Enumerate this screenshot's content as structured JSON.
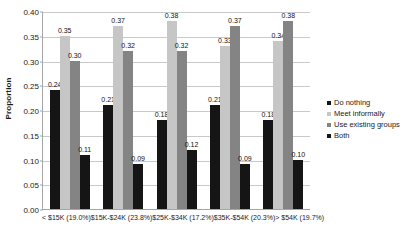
{
  "chart_data": {
    "type": "bar",
    "title": "",
    "xlabel": "",
    "ylabel": "Proportion",
    "ylim": [
      0.0,
      0.4
    ],
    "ytick_labels": [
      "0.00",
      "0.05",
      "0.10",
      "0.15",
      "0.20",
      "0.25",
      "0.30",
      "0.35",
      "0.40"
    ],
    "ytick_values": [
      0.0,
      0.05,
      0.1,
      0.15,
      0.2,
      0.25,
      0.3,
      0.35,
      0.4
    ],
    "grid": true,
    "legend_position": "right",
    "categories": [
      "< $15K (19.0%)",
      "$15K-$24K (23.8%)",
      "$25K-$34K (17.2%)",
      "$35K-$54K (20.3%)",
      "> $54K (19.7%)"
    ],
    "series": [
      {
        "name": "Do nothing",
        "color": "#151515",
        "values": [
          0.24,
          0.21,
          0.18,
          0.21,
          0.18
        ],
        "labels": [
          "0.24",
          "0.21",
          "0.18",
          "0.21",
          "0.18"
        ]
      },
      {
        "name": "Meet informally",
        "color": "#c6c6c6",
        "values": [
          0.35,
          0.37,
          0.38,
          0.33,
          0.34
        ],
        "labels": [
          "0.35",
          "0.37",
          "0.38",
          "0.33",
          "0.34"
        ]
      },
      {
        "name": "Use existing groups",
        "color": "#848484",
        "values": [
          0.3,
          0.32,
          0.32,
          0.37,
          0.38
        ],
        "labels": [
          "0.30",
          "0.32",
          "0.32",
          "0.37",
          "0.38"
        ]
      },
      {
        "name": "Both",
        "color": "#151515",
        "values": [
          0.11,
          0.09,
          0.12,
          0.09,
          0.1
        ],
        "labels": [
          "0.11",
          "0.09",
          "0.12",
          "0.09",
          "0.10"
        ]
      }
    ]
  }
}
